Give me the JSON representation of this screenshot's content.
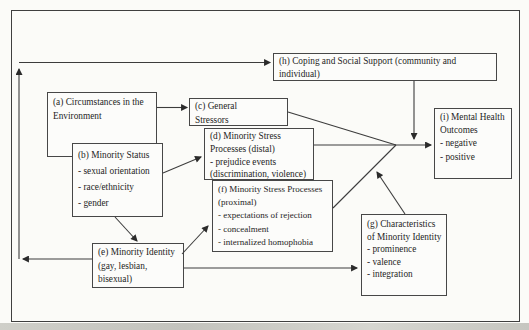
{
  "figure": {
    "kind": "path-model-diagram",
    "boxes": {
      "a": {
        "lines": [
          "(a) Circumstances in the",
          "Environment"
        ]
      },
      "b": {
        "lines": [
          "(b) Minority Status",
          "- sexual orientation",
          "- race/ethnicity",
          "- gender"
        ]
      },
      "c": {
        "lines": [
          "(c) General",
          "Stressors"
        ]
      },
      "d": {
        "lines": [
          "(d) Minority Stress",
          "Processes (distal)",
          "- prejudice events",
          "(discrimination, violence)"
        ]
      },
      "e": {
        "lines": [
          "(e) Minority Identity",
          "(gay, lesbian,",
          "bisexual)"
        ]
      },
      "f": {
        "lines": [
          "(f) Minority Stress Processes",
          "(proximal)",
          "- expectations of rejection",
          "- concealment",
          "- internalized homophobia"
        ]
      },
      "g": {
        "lines": [
          "(g) Characteristics",
          "of Minority Identity",
          "- prominence",
          "- valence",
          "- integration"
        ]
      },
      "h": {
        "lines": [
          "(h) Coping and Social Support (community and",
          "individual)"
        ]
      },
      "i": {
        "lines": [
          "(i) Mental Health",
          "Outcomes",
          "- negative",
          "- positive"
        ]
      }
    },
    "connections": [
      {
        "from": "a",
        "to": "c"
      },
      {
        "from": "b",
        "to": "d"
      },
      {
        "from": "b",
        "to": "e"
      },
      {
        "from": "e",
        "to": "f"
      },
      {
        "from": "e",
        "to": "g"
      },
      {
        "from": "e",
        "to": "h",
        "route": "left-and-top-of-frame"
      },
      {
        "from": "c",
        "to": "i",
        "route": "merge-point"
      },
      {
        "from": "d",
        "to": "i",
        "route": "merge-point"
      },
      {
        "from": "f",
        "to": "i",
        "route": "merge-point"
      },
      {
        "from": "h",
        "to": "stress-outcome-arrow",
        "type": "moderation"
      },
      {
        "from": "g",
        "to": "f-outcome-line",
        "type": "moderation"
      }
    ],
    "colors": {
      "background": "#fbfbf8",
      "box_fill": "#fcfcfa",
      "border": "#474747",
      "line": "#3c3c3c",
      "text": "#1e1e1e",
      "scan_band": "#c8c8c2"
    }
  }
}
